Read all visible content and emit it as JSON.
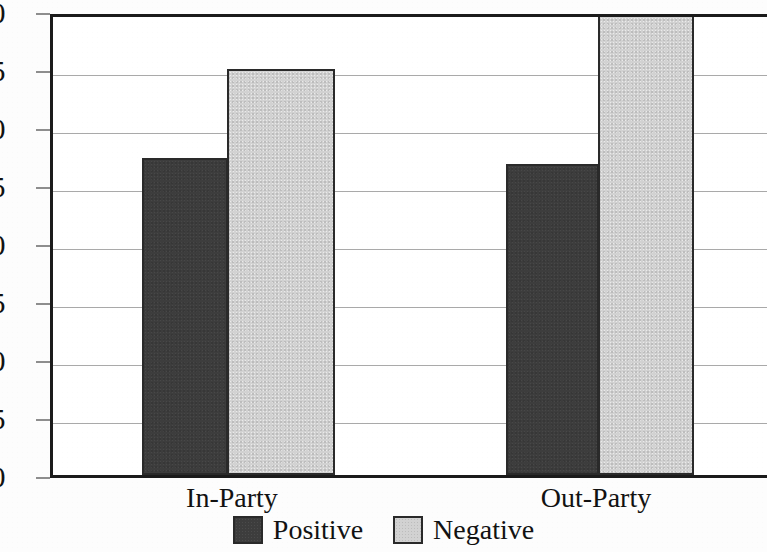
{
  "chart_data": {
    "type": "bar",
    "title": "",
    "subtitle": "",
    "xlabel": "",
    "ylabel": "",
    "categories": [
      "In-Party",
      "Out-Party"
    ],
    "series": [
      {
        "name": "Positive",
        "color": "#3d3d3d",
        "values": [
          27.3,
          26.8
        ]
      },
      {
        "name": "Negative",
        "color": "#d2d2d2",
        "values": [
          35.0,
          40.5
        ]
      }
    ],
    "ylim": [
      0,
      40
    ],
    "ytick_values": [
      0,
      5,
      10,
      15,
      20,
      25,
      30,
      35,
      40
    ],
    "ytick_labels": [
      "0",
      "5",
      "10",
      "15",
      "20",
      "25",
      "30",
      "35",
      "40"
    ],
    "grid": true,
    "grid_axis": "y",
    "legend_position": "bottom-center",
    "clipped_bars": [
      "Out-Party / Negative"
    ]
  },
  "axis": {
    "y_ticks": [
      {
        "label": "40",
        "value": 40
      },
      {
        "label": "35",
        "value": 35
      },
      {
        "label": "30",
        "value": 30
      },
      {
        "label": "25",
        "value": 25
      },
      {
        "label": "20",
        "value": 20
      },
      {
        "label": "15",
        "value": 15
      },
      {
        "label": "10",
        "value": 10
      },
      {
        "label": "5",
        "value": 5
      },
      {
        "label": "0",
        "value": 0
      }
    ]
  },
  "categories": [
    {
      "label": "In-Party"
    },
    {
      "label": "Out-Party"
    }
  ],
  "bars": [
    {
      "name": "in-party-positive",
      "series": "Positive",
      "category": "In-Party",
      "value": 27.3
    },
    {
      "name": "in-party-negative",
      "series": "Negative",
      "category": "In-Party",
      "value": 35.0
    },
    {
      "name": "out-party-positive",
      "series": "Positive",
      "category": "Out-Party",
      "value": 26.8
    },
    {
      "name": "out-party-negative",
      "series": "Negative",
      "category": "Out-Party",
      "value": 40.5
    }
  ],
  "legend": {
    "items": [
      {
        "label": "Positive",
        "color": "#3d3d3d"
      },
      {
        "label": "Negative",
        "color": "#d2d2d2"
      }
    ]
  },
  "colors": {
    "positive": "#3d3d3d",
    "negative": "#d2d2d2",
    "axis": "#1b1b1b",
    "gridline": "#a9a9a9",
    "text": "#121212",
    "background": "#ffffff"
  }
}
